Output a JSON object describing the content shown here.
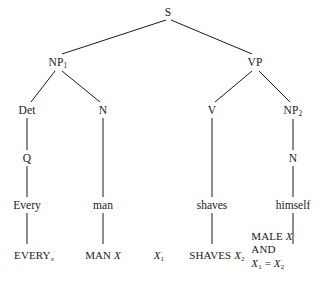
{
  "figure": {
    "type": "syntax-tree",
    "title": "",
    "background_color": "#ffffff",
    "line_color": "#1a1a1a",
    "text_color": "#1a1a1a"
  },
  "nodes": {
    "s": {
      "label": "S",
      "x": 168,
      "y": 12
    },
    "np1": {
      "label": "NP",
      "sub": "1",
      "x": 58,
      "y": 62
    },
    "vp": {
      "label": "VP",
      "x": 255,
      "y": 62
    },
    "det": {
      "label": "Det",
      "x": 27,
      "y": 110
    },
    "n1": {
      "label": "N",
      "x": 103,
      "y": 110
    },
    "v": {
      "label": "V",
      "x": 212,
      "y": 110
    },
    "np2": {
      "label": "NP",
      "sub": "2",
      "x": 293,
      "y": 110
    },
    "q": {
      "label": "Q",
      "x": 27,
      "y": 158
    },
    "n2": {
      "label": "N",
      "x": 293,
      "y": 158
    }
  },
  "words": [
    {
      "label": "Every",
      "x": 27,
      "y": 205
    },
    {
      "label": "man",
      "x": 103,
      "y": 205
    },
    {
      "label": "shaves",
      "x": 212,
      "y": 205
    },
    {
      "label": "himself",
      "x": 293,
      "y": 205
    }
  ],
  "logical_forms": [
    {
      "name": "every",
      "x": 34,
      "y": 256,
      "parts": [
        {
          "text": "EVERY",
          "style": "smallcaps"
        },
        {
          "text": "x",
          "style": "subscript-italic"
        }
      ]
    },
    {
      "name": "man",
      "x": 103,
      "y": 256,
      "parts": [
        {
          "text": "MAN",
          "style": "smallcaps"
        },
        {
          "text": " ",
          "style": "plain"
        },
        {
          "text": "X",
          "style": "italic"
        }
      ]
    },
    {
      "name": "x1",
      "x": 159,
      "y": 256,
      "parts": [
        {
          "text": "X",
          "style": "italic"
        },
        {
          "text": "1",
          "style": "subscript"
        }
      ]
    },
    {
      "name": "shaves",
      "x": 217,
      "y": 256,
      "parts": [
        {
          "text": "SHAVES",
          "style": "smallcaps"
        },
        {
          "text": " ",
          "style": "plain"
        },
        {
          "text": "X",
          "style": "italic"
        },
        {
          "text": "2",
          "style": "subscript"
        }
      ]
    }
  ],
  "logical_form_block": {
    "name": "male-and-identity",
    "x": 272,
    "y": 250,
    "lines": [
      {
        "parts": [
          {
            "text": "MALE",
            "style": "smallcaps"
          },
          {
            "text": " ",
            "style": "plain"
          },
          {
            "text": "X",
            "style": "italic"
          }
        ]
      },
      {
        "parts": [
          {
            "text": "AND",
            "style": "smallcaps"
          }
        ]
      },
      {
        "parts": [
          {
            "text": "X",
            "style": "italic"
          },
          {
            "text": "1",
            "style": "subscript"
          },
          {
            "text": " = ",
            "style": "plain"
          },
          {
            "text": "X",
            "style": "italic"
          },
          {
            "text": "2",
            "style": "subscript"
          }
        ]
      }
    ]
  },
  "edges": [
    {
      "from": "s",
      "to": "np1",
      "x1": 166,
      "y1": 20,
      "x2": 62,
      "y2": 54
    },
    {
      "from": "s",
      "to": "vp",
      "x1": 171,
      "y1": 20,
      "x2": 252,
      "y2": 54
    },
    {
      "from": "np1",
      "to": "det",
      "x1": 55,
      "y1": 71,
      "x2": 31,
      "y2": 102
    },
    {
      "from": "np1",
      "to": "n1",
      "x1": 62,
      "y1": 71,
      "x2": 100,
      "y2": 102
    },
    {
      "from": "vp",
      "to": "v",
      "x1": 252,
      "y1": 71,
      "x2": 215,
      "y2": 102
    },
    {
      "from": "vp",
      "to": "np2",
      "x1": 259,
      "y1": 71,
      "x2": 290,
      "y2": 102
    },
    {
      "from": "det",
      "to": "q",
      "x1": 27,
      "y1": 118,
      "x2": 27,
      "y2": 150
    },
    {
      "from": "np2",
      "to": "n2",
      "x1": 293,
      "y1": 119,
      "x2": 293,
      "y2": 150
    },
    {
      "from": "q",
      "to": "word-every",
      "x1": 27,
      "y1": 166,
      "x2": 27,
      "y2": 197
    },
    {
      "from": "n1",
      "to": "word-man",
      "x1": 103,
      "y1": 118,
      "x2": 103,
      "y2": 197
    },
    {
      "from": "v",
      "to": "word-shaves",
      "x1": 212,
      "y1": 118,
      "x2": 212,
      "y2": 197
    },
    {
      "from": "n2",
      "to": "word-himself",
      "x1": 293,
      "y1": 166,
      "x2": 293,
      "y2": 197
    },
    {
      "from": "word-every",
      "to": "lf-every",
      "x1": 27,
      "y1": 213,
      "x2": 27,
      "y2": 244
    },
    {
      "from": "word-man",
      "to": "lf-man",
      "x1": 103,
      "y1": 213,
      "x2": 103,
      "y2": 244
    },
    {
      "from": "word-shaves",
      "to": "lf-shaves",
      "x1": 212,
      "y1": 213,
      "x2": 212,
      "y2": 244
    },
    {
      "from": "word-himself",
      "to": "lf-male",
      "x1": 293,
      "y1": 213,
      "x2": 293,
      "y2": 244
    }
  ]
}
